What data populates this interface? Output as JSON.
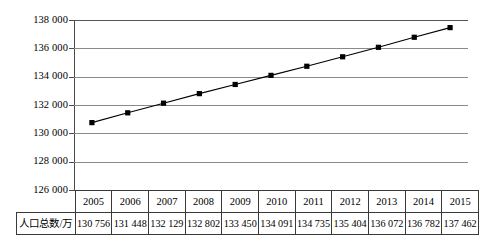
{
  "chart_data": {
    "type": "line",
    "title": "",
    "xlabel": "",
    "ylabel": "",
    "categories": [
      "2005",
      "2006",
      "2007",
      "2008",
      "2009",
      "2010",
      "2011",
      "2012",
      "2013",
      "2014",
      "2015"
    ],
    "values": [
      130756,
      131448,
      132129,
      132802,
      133450,
      134091,
      134735,
      135404,
      136072,
      136782,
      137462
    ],
    "value_labels": [
      "130 756",
      "131 448",
      "132 129",
      "132 802",
      "133 450",
      "134 091",
      "134 735",
      "135 404",
      "136 072",
      "136 782",
      "137 462"
    ],
    "ylim": [
      126000,
      138000
    ],
    "ytick_values": [
      138000,
      136000,
      134000,
      132000,
      130000,
      128000,
      126000
    ],
    "ytick_labels": [
      "138 000",
      "136 000",
      "134 000",
      "132 000",
      "130 000",
      "128 000",
      "126 000"
    ],
    "grid": true,
    "legend": false,
    "marker": "filled-square",
    "series_color": "#000000",
    "gridline_color": "#8a8a8a"
  },
  "table": {
    "row_header": "人口总数/万",
    "year_header": [
      "2005",
      "2006",
      "2007",
      "2008",
      "2009",
      "2010",
      "2011",
      "2012",
      "2013",
      "2014",
      "2015"
    ],
    "values": [
      "130 756",
      "131 448",
      "132 129",
      "132 802",
      "133 450",
      "134 091",
      "134 735",
      "135 404",
      "136 072",
      "136 782",
      "137 462"
    ]
  }
}
